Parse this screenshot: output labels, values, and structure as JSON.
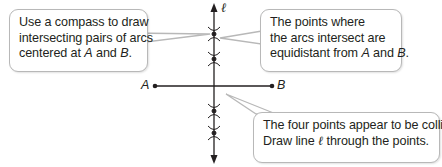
{
  "callouts": {
    "left": {
      "line1": "Use a compass to draw",
      "line2": "intersecting pairs of arcs",
      "line3_prefix": "centered at ",
      "line3_a": "A",
      "line3_mid": " and ",
      "line3_b": "B",
      "line3_suffix": "."
    },
    "right_top": {
      "line1": "The points where",
      "line2": "the arcs intersect are",
      "line3_prefix": "equidistant from ",
      "line3_a": "A",
      "line3_mid": " and ",
      "line3_b": "B",
      "line3_suffix": "."
    },
    "bottom": {
      "line1": "The four points appear to be collinear.",
      "line2_prefix": "Draw line ",
      "line2_ell": "ℓ",
      "line2_suffix": " through the points."
    }
  },
  "labels": {
    "point_a": "A",
    "point_b": "B",
    "line_name": "ℓ"
  },
  "colors": {
    "stroke": "#231f20",
    "callout_border": "#b8b8b8",
    "background": "#ffffff"
  }
}
